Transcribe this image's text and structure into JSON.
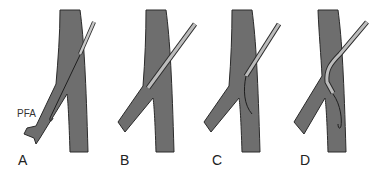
{
  "figure": {
    "panels": [
      {
        "label": "A"
      },
      {
        "label": "B"
      },
      {
        "label": "C"
      },
      {
        "label": "D"
      }
    ],
    "annotation": "PFA",
    "colors": {
      "vessel": "#6e6e6e",
      "outline": "#2a2a2a",
      "catheter": "#b4b4b4"
    }
  }
}
